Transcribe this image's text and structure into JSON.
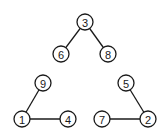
{
  "diagram": {
    "type": "forest",
    "node_radius": 8,
    "nodes": [
      {
        "id": "3",
        "label": "3",
        "x": 85,
        "y": 22
      },
      {
        "id": "6",
        "label": "6",
        "x": 61,
        "y": 54
      },
      {
        "id": "8",
        "label": "8",
        "x": 108,
        "y": 54
      },
      {
        "id": "9",
        "label": "9",
        "x": 43,
        "y": 83
      },
      {
        "id": "1",
        "label": "1",
        "x": 22,
        "y": 119
      },
      {
        "id": "4",
        "label": "4",
        "x": 68,
        "y": 119
      },
      {
        "id": "5",
        "label": "5",
        "x": 126,
        "y": 83
      },
      {
        "id": "7",
        "label": "7",
        "x": 102,
        "y": 119
      },
      {
        "id": "2",
        "label": "2",
        "x": 148,
        "y": 119
      }
    ],
    "edges": [
      {
        "from": "3",
        "to": "6"
      },
      {
        "from": "3",
        "to": "8"
      },
      {
        "from": "9",
        "to": "1"
      },
      {
        "from": "1",
        "to": "4"
      },
      {
        "from": "5",
        "to": "2"
      },
      {
        "from": "7",
        "to": "2"
      }
    ]
  }
}
